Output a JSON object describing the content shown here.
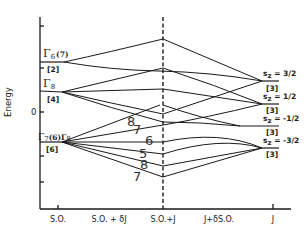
{
  "diagram": {
    "y_axis_label": "Energy",
    "y_zero_label": "0",
    "x_labels": [
      "S.O.",
      "S.O. + δJ",
      "S.O.+J",
      "J+δS.O.",
      "J"
    ],
    "left_levels": [
      {
        "gamma": "Γ",
        "sub": "6",
        "extra": "(7)",
        "degeneracy": "[2]"
      },
      {
        "gamma": "Γ",
        "sub": "8",
        "extra": "",
        "degeneracy": "[4]"
      },
      {
        "gamma": "Γ",
        "sub": "7",
        "extra": "(6)Γ",
        "extra_sub": "8",
        "degeneracy": "[6]"
      }
    ],
    "right_levels": [
      {
        "label": "s",
        "sub": "z",
        "value": " = 3/2",
        "degeneracy": "[3]"
      },
      {
        "label": "s",
        "sub": "z",
        "value": " = 1/2",
        "degeneracy": "[3]"
      },
      {
        "label": "s",
        "sub": "z",
        "value": " = -1/2",
        "degeneracy": "[3]"
      },
      {
        "label": "s",
        "sub": "z",
        "value": " = -3/2",
        "degeneracy": "[3]"
      }
    ],
    "branch_numbers": [
      "8",
      "7",
      "6",
      "5",
      "8",
      "7"
    ]
  }
}
